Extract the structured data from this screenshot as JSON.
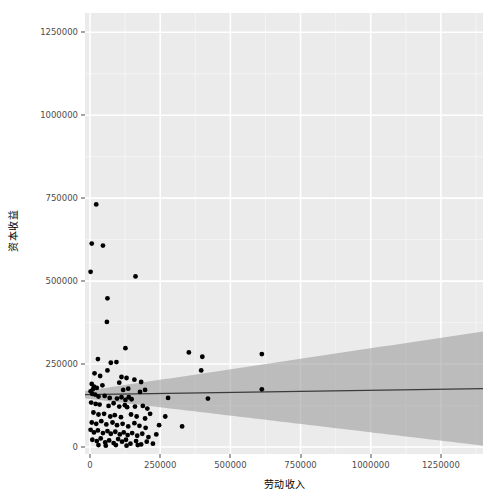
{
  "chart_data": {
    "type": "scatter",
    "title": "",
    "xlabel": "劳动收入",
    "ylabel": "资本收益",
    "xlim": [
      -18000,
      1400000
    ],
    "ylim": [
      -21000,
      1308000
    ],
    "xticks": [
      0,
      250000,
      500000,
      750000,
      1000000,
      1250000
    ],
    "yticks": [
      0,
      250000,
      500000,
      750000,
      1000000,
      1250000
    ],
    "xticklabels": [
      "0",
      "250000",
      "500000",
      "750000",
      "1000000",
      "1250000"
    ],
    "yticklabels": [
      "0",
      "250000",
      "500000",
      "750000",
      "1000000",
      "1250000"
    ],
    "grid": true,
    "grid_color": "#ffffff",
    "panel_background": "#ebebeb",
    "legend": "none",
    "point_color": "#000000",
    "point_size": 2.4,
    "regression": {
      "type": "linear-fit",
      "line_color": "#3b3b3b",
      "band_color": "#a0a0a0",
      "intercept": 158000,
      "slope": 0.013,
      "band_halfwidth_at_x0": 11000,
      "band_halfwidth_at_xmax": 172000
    },
    "points": [
      [
        22000,
        731000
      ],
      [
        6000,
        613000
      ],
      [
        46000,
        607000
      ],
      [
        2000,
        528000
      ],
      [
        62000,
        448000
      ],
      [
        60000,
        377000
      ],
      [
        162000,
        514000
      ],
      [
        126000,
        298000
      ],
      [
        28000,
        265000
      ],
      [
        74000,
        254000
      ],
      [
        94000,
        256000
      ],
      [
        62000,
        231000
      ],
      [
        352000,
        285000
      ],
      [
        400000,
        272000
      ],
      [
        612000,
        280000
      ],
      [
        396000,
        231000
      ],
      [
        16000,
        222000
      ],
      [
        36000,
        214000
      ],
      [
        112000,
        211000
      ],
      [
        130000,
        208000
      ],
      [
        158000,
        203000
      ],
      [
        104000,
        194000
      ],
      [
        182000,
        196000
      ],
      [
        6000,
        190000
      ],
      [
        14000,
        182000
      ],
      [
        10000,
        174000
      ],
      [
        24000,
        178000
      ],
      [
        44000,
        186000
      ],
      [
        118000,
        172000
      ],
      [
        136000,
        176000
      ],
      [
        178000,
        166000
      ],
      [
        196000,
        172000
      ],
      [
        2000,
        168000
      ],
      [
        8000,
        160000
      ],
      [
        18000,
        158000
      ],
      [
        30000,
        152000
      ],
      [
        52000,
        154000
      ],
      [
        70000,
        148000
      ],
      [
        96000,
        146000
      ],
      [
        112000,
        150000
      ],
      [
        126000,
        142000
      ],
      [
        138000,
        150000
      ],
      [
        148000,
        144000
      ],
      [
        612000,
        174000
      ],
      [
        278000,
        148000
      ],
      [
        420000,
        146000
      ],
      [
        4000,
        134000
      ],
      [
        20000,
        130000
      ],
      [
        34000,
        128000
      ],
      [
        66000,
        124000
      ],
      [
        84000,
        132000
      ],
      [
        104000,
        122000
      ],
      [
        124000,
        126000
      ],
      [
        132000,
        120000
      ],
      [
        160000,
        122000
      ],
      [
        188000,
        124000
      ],
      [
        204000,
        116000
      ],
      [
        12000,
        104000
      ],
      [
        30000,
        98000
      ],
      [
        50000,
        100000
      ],
      [
        72000,
        92000
      ],
      [
        88000,
        96000
      ],
      [
        110000,
        90000
      ],
      [
        146000,
        98000
      ],
      [
        166000,
        92000
      ],
      [
        196000,
        86000
      ],
      [
        214000,
        100000
      ],
      [
        268000,
        92000
      ],
      [
        6000,
        74000
      ],
      [
        22000,
        70000
      ],
      [
        40000,
        78000
      ],
      [
        58000,
        68000
      ],
      [
        80000,
        74000
      ],
      [
        96000,
        66000
      ],
      [
        116000,
        70000
      ],
      [
        136000,
        62000
      ],
      [
        158000,
        72000
      ],
      [
        176000,
        64000
      ],
      [
        198000,
        58000
      ],
      [
        246000,
        66000
      ],
      [
        328000,
        62000
      ],
      [
        2000,
        52000
      ],
      [
        14000,
        44000
      ],
      [
        28000,
        50000
      ],
      [
        46000,
        42000
      ],
      [
        62000,
        48000
      ],
      [
        74000,
        40000
      ],
      [
        90000,
        46000
      ],
      [
        106000,
        38000
      ],
      [
        120000,
        44000
      ],
      [
        134000,
        36000
      ],
      [
        150000,
        42000
      ],
      [
        168000,
        34000
      ],
      [
        186000,
        40000
      ],
      [
        208000,
        30000
      ],
      [
        236000,
        38000
      ],
      [
        8000,
        22000
      ],
      [
        24000,
        18000
      ],
      [
        38000,
        26000
      ],
      [
        54000,
        14000
      ],
      [
        68000,
        20000
      ],
      [
        84000,
        12000
      ],
      [
        100000,
        24000
      ],
      [
        114000,
        16000
      ],
      [
        128000,
        22000
      ],
      [
        144000,
        10000
      ],
      [
        164000,
        18000
      ],
      [
        182000,
        8000
      ],
      [
        202000,
        16000
      ],
      [
        224000,
        10000
      ],
      [
        30000,
        6000
      ],
      [
        56000,
        4000
      ],
      [
        92000,
        6000
      ],
      [
        130000,
        4000
      ],
      [
        170000,
        6000
      ]
    ]
  },
  "axes": {
    "y_title": "资本收益",
    "x_title": "劳动收入"
  }
}
